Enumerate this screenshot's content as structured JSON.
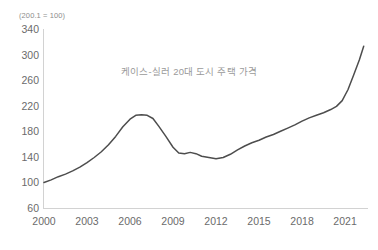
{
  "chart_data": {
    "type": "line",
    "title": "케이스-실러 20대 도시 주택 가격",
    "note": "(200.1 = 100)",
    "xlabel": "",
    "ylabel": "",
    "grid": false,
    "legend": "none",
    "line_color": "#4d4d4d",
    "axis_color": "#d2d2d2",
    "tick_label_color": "#6b6b6b",
    "title_color": "#9a9a9a",
    "xlim": [
      2000,
      2022.6
    ],
    "ylim": [
      60,
      340
    ],
    "yticks": [
      340,
      300,
      260,
      220,
      180,
      140,
      100,
      60
    ],
    "xticks": [
      2000,
      2003,
      2006,
      2009,
      2012,
      2015,
      2018,
      2021
    ],
    "series": [
      {
        "name": "케이스-실러 20대 도시 주택 가격",
        "x": [
          2000.0,
          2000.5,
          2001.0,
          2001.5,
          2002.0,
          2002.5,
          2003.0,
          2003.5,
          2004.0,
          2004.5,
          2005.0,
          2005.5,
          2006.0,
          2006.4,
          2006.8,
          2007.2,
          2007.6,
          2008.0,
          2008.5,
          2009.0,
          2009.4,
          2009.8,
          2010.2,
          2010.6,
          2011.0,
          2011.5,
          2012.0,
          2012.5,
          2013.0,
          2013.5,
          2014.0,
          2014.5,
          2015.0,
          2015.5,
          2016.0,
          2016.5,
          2017.0,
          2017.5,
          2018.0,
          2018.5,
          2019.0,
          2019.5,
          2020.0,
          2020.4,
          2020.8,
          2021.2,
          2021.6,
          2022.0,
          2022.3
        ],
        "values": [
          100,
          104,
          109,
          113,
          118,
          124,
          131,
          139,
          148,
          159,
          172,
          187,
          199,
          205,
          206,
          205,
          200,
          188,
          172,
          155,
          146,
          145,
          147,
          145,
          141,
          139,
          137,
          139,
          144,
          151,
          157,
          162,
          166,
          171,
          175,
          180,
          185,
          190,
          196,
          201,
          205,
          209,
          214,
          219,
          228,
          245,
          268,
          292,
          313
        ]
      }
    ]
  }
}
